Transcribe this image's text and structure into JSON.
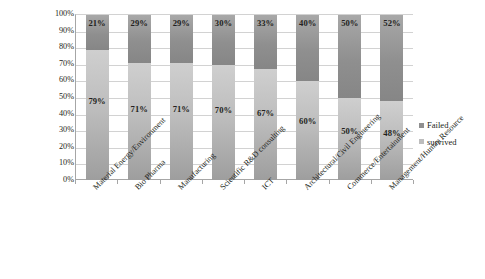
{
  "chart_data": {
    "type": "bar",
    "stacked": true,
    "stacked_percent": true,
    "title": "",
    "subtitle": "",
    "xlabel": "",
    "ylabel": "",
    "ylim": [
      0,
      100
    ],
    "grid": true,
    "legend_position": "right",
    "categories": [
      "Material Energy/Environment",
      "Bio Pharma",
      "Manufacturing",
      "Scientific R&D consulting",
      "ICT",
      "Architectural/Civil Engineering",
      "Commerce/Entertainment",
      "Management/Human Resource"
    ],
    "series": [
      {
        "name": "Failed",
        "color": "#8f8f8f",
        "values": [
          21,
          29,
          29,
          30,
          33,
          40,
          50,
          52
        ],
        "labels": [
          "21%",
          "29%",
          "29%",
          "30%",
          "33%",
          "40%",
          "50%",
          "52%"
        ]
      },
      {
        "name": "survived",
        "color": "#bdbdbd",
        "values": [
          79,
          71,
          71,
          70,
          67,
          60,
          50,
          48
        ],
        "labels": [
          "79%",
          "71%",
          "71%",
          "70%",
          "67%",
          "60%",
          "50%",
          "48%"
        ]
      }
    ],
    "y_ticks": [
      "100%",
      "90%",
      "80%",
      "70%",
      "60%",
      "50%",
      "40%",
      "30%",
      "20%",
      "10%",
      "0%"
    ],
    "y_tick_values": [
      100,
      90,
      80,
      70,
      60,
      50,
      40,
      30,
      20,
      10,
      0
    ]
  },
  "legend": {
    "items": [
      {
        "label": "Failed",
        "swatch": "failed"
      },
      {
        "label": "survived",
        "swatch": "survived"
      }
    ]
  }
}
